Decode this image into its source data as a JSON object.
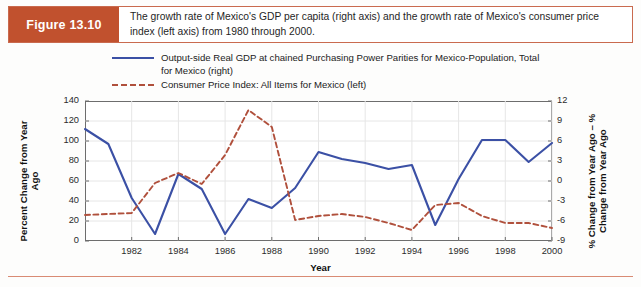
{
  "figure": {
    "badge": "Figure 13.10",
    "caption": "The growth rate of Mexico's GDP per capita (right axis) and the growth rate of Mexico's consumer price index (left axis) from 1980 through 2000."
  },
  "colors": {
    "badge_bg": "#c1512e",
    "frame_border": "#c96a4e",
    "gdp_line": "#3b50a5",
    "cpi_line": "#b0503c",
    "axis": "#6d6d6d",
    "grid": "#e6e6e6"
  },
  "legend": {
    "position": "top",
    "items": [
      {
        "label": "Output-side Real GDP at chained Purchasing Power Parities for Mexico-Population, Total for Mexico (right)",
        "style": "solid",
        "color": "#3b50a5"
      },
      {
        "label": "Consumer Price Index: All Items for Mexico (left)",
        "style": "dashed",
        "color": "#b0503c"
      }
    ]
  },
  "chart_data": {
    "type": "line",
    "title": "",
    "xlabel": "Year",
    "ylabel": "Percent Change from Year Ago",
    "ylabel_right": "% Change from Year Ago – % Change from Year Ago",
    "xlim": [
      1980,
      2000
    ],
    "ylim": [
      0,
      140
    ],
    "ylim_right": [
      -9,
      12
    ],
    "grid": true,
    "x": [
      1980,
      1981,
      1982,
      1983,
      1984,
      1985,
      1986,
      1987,
      1988,
      1989,
      1990,
      1991,
      1992,
      1993,
      1994,
      1995,
      1996,
      1997,
      1998,
      1999,
      2000
    ],
    "xticks": [
      1982,
      1984,
      1986,
      1988,
      1990,
      1992,
      1994,
      1996,
      1998,
      2000
    ],
    "yticks_left": [
      0,
      20,
      40,
      60,
      80,
      100,
      120,
      140
    ],
    "yticks_right": [
      -9,
      -6,
      -3,
      0,
      3,
      6,
      9,
      12
    ],
    "series": [
      {
        "name": "Output-side Real GDP at chained Purchasing Power Parities for Mexico-Population, Total for Mexico (right)",
        "axis": "right",
        "style": "solid",
        "color": "#3b50a5",
        "values_left_scale": [
          112,
          97,
          43,
          7,
          67,
          52,
          7,
          42,
          33,
          53,
          89,
          82,
          78,
          72,
          76,
          16,
          62,
          101,
          101,
          79,
          98
        ],
        "values": [
          7.8,
          5.5,
          -2.6,
          -8.0,
          1.1,
          -1.2,
          -8.0,
          -3.7,
          -5.1,
          -2.1,
          3.3,
          2.3,
          1.7,
          0.8,
          1.4,
          -7.1,
          -0.2,
          5.7,
          5.7,
          2.4,
          5.2
        ]
      },
      {
        "name": "Consumer Price Index: All Items for Mexico (left)",
        "axis": "left",
        "style": "dashed",
        "color": "#b0503c",
        "values": [
          26,
          27,
          28,
          58,
          68,
          57,
          86,
          131,
          114,
          21,
          25,
          27,
          24,
          18,
          11,
          36,
          38,
          25,
          18,
          18,
          13
        ]
      }
    ]
  }
}
